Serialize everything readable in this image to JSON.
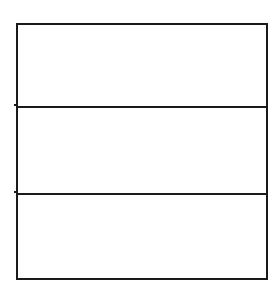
{
  "diagram": {
    "type": "stacked-rectangles",
    "stroke_color": "#1a1a1a",
    "background_color": "#ffffff",
    "cells": [
      {
        "label": ""
      },
      {
        "label": ""
      },
      {
        "label": ""
      }
    ]
  }
}
